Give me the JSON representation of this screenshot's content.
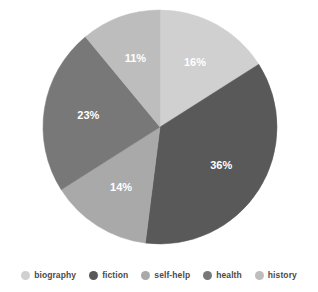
{
  "chart_data": {
    "type": "pie",
    "title": "",
    "categories": [
      "biography",
      "fiction",
      "self-help",
      "health",
      "history"
    ],
    "values": [
      16,
      36,
      14,
      23,
      11
    ],
    "value_labels": [
      "16%",
      "36%",
      "14%",
      "23%",
      "11%"
    ],
    "units": "percent",
    "start_angle_deg": 0,
    "direction": "clockwise",
    "colors": [
      "#d0d0d0",
      "#595959",
      "#a9a9a9",
      "#787878",
      "#bdbdbd"
    ],
    "legend_position": "bottom",
    "grid": false,
    "xlabel": "",
    "ylabel": "",
    "label_text_color": "#ffffff",
    "background_color": "#ffffff"
  },
  "legend": {
    "items": [
      {
        "label": "biography",
        "color": "#d0d0d0"
      },
      {
        "label": "fiction",
        "color": "#595959"
      },
      {
        "label": "self-help",
        "color": "#a9a9a9"
      },
      {
        "label": "health",
        "color": "#787878"
      },
      {
        "label": "history",
        "color": "#bdbdbd"
      }
    ]
  },
  "slices": [
    {
      "label": "biography",
      "percent_text": "16%"
    },
    {
      "label": "fiction",
      "percent_text": "36%"
    },
    {
      "label": "self-help",
      "percent_text": "14%"
    },
    {
      "label": "health",
      "percent_text": "23%"
    },
    {
      "label": "history",
      "percent_text": "11%"
    }
  ]
}
